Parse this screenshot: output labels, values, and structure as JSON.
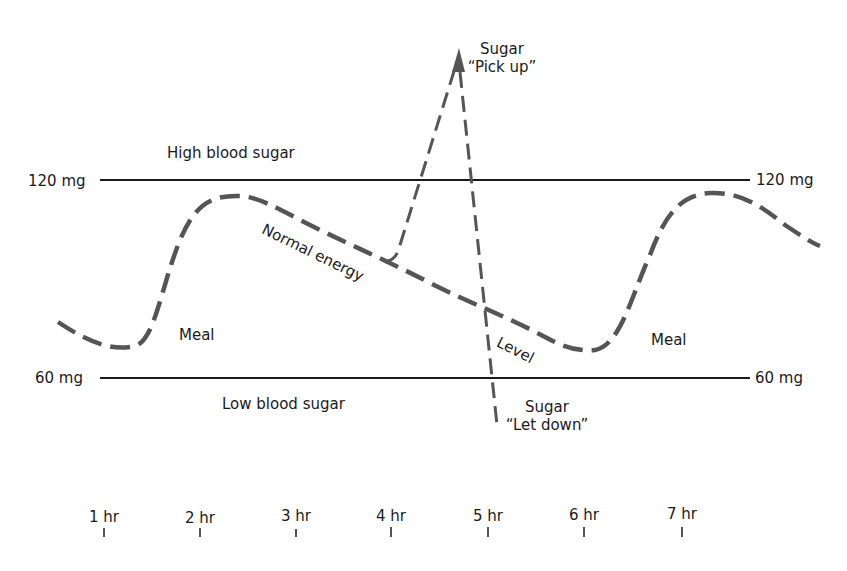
{
  "diagram": {
    "title": "",
    "zones": {
      "high_label": "High blood sugar",
      "low_label": "Low blood sugar"
    },
    "thresholds": {
      "high": {
        "left_label": "120 mg",
        "right_label": "120 mg",
        "value": 120
      },
      "low": {
        "left_label": "60 mg",
        "right_label": "60 mg",
        "value": 60
      }
    },
    "curve_labels": {
      "meal_1": "Meal",
      "meal_2": "Meal",
      "normal_energy": "Normal energy",
      "level": "Level"
    },
    "spike": {
      "pick_up_line1": "Sugar",
      "pick_up_line2": "“Pick up”",
      "let_down_line1": "Sugar",
      "let_down_line2": "“Let down”"
    },
    "time_axis": {
      "ticks": [
        "1 hr",
        "2 hr",
        "3 hr",
        "4 hr",
        "5 hr",
        "6 hr",
        "7 hr"
      ]
    },
    "colors": {
      "curve": "#555555",
      "threshold_line": "#1a1a1a",
      "text": "#1a1a1a",
      "background": "#ffffff"
    }
  }
}
